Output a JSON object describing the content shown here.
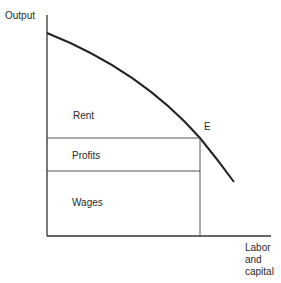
{
  "diagram": {
    "axes": {
      "y_label": "Output",
      "x_label_lines": [
        "Labor",
        "and",
        "capital"
      ]
    },
    "regions": {
      "rent": "Rent",
      "profits": "Profits",
      "wages": "Wages"
    },
    "point_label": "E",
    "colors": {
      "line": "#222222",
      "thin_line": "#444444",
      "background": "#ffffff"
    }
  }
}
